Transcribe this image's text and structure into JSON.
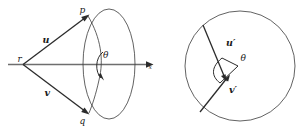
{
  "figure": {
    "background_color": "#ffffff",
    "ink_color": "#2b2b2b",
    "axis_color": "#6e6e6e",
    "outline_color": "#3a3a3a",
    "left_diagram": {
      "name": "cone-with-apex-r",
      "apex_label": "r",
      "point_top_label": "p",
      "point_bottom_label": "q",
      "vector_upper_label": "u",
      "vector_lower_label": "v",
      "angle_label": "θ",
      "axis_label": "x",
      "axis_has_arrow": true
    },
    "right_diagram": {
      "name": "disc-projection",
      "vector_upper_label": "u′",
      "vector_lower_label": "v′",
      "angle_label": "θ",
      "outline_shape": "circle"
    }
  }
}
